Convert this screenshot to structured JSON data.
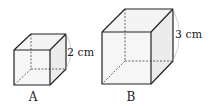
{
  "cubes": [
    {
      "name": "A",
      "label": "A",
      "edge_label": "2 cm"
    },
    {
      "name": "B",
      "label": "B",
      "edge_label": "3 cm"
    }
  ],
  "colors": {
    "edge": "#222222",
    "face": "#f2f2f2",
    "arc": "#bbbbbb"
  }
}
